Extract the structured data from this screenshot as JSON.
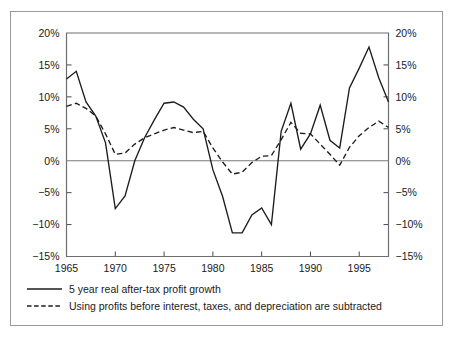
{
  "chart_data": {
    "type": "line",
    "title": "",
    "subtitle": "",
    "xlabel": "",
    "ylabel": "",
    "xlim": [
      1965,
      1998
    ],
    "ylim": [
      -15,
      20
    ],
    "ytick_labels": [
      "20%",
      "15%",
      "10%",
      "5%",
      "0%",
      "-5%",
      "-10%",
      "-15%"
    ],
    "ytick_values": [
      20,
      15,
      10,
      5,
      0,
      -5,
      -10,
      -15
    ],
    "ytick_labels_right": [
      "20%",
      "15%",
      "10%",
      "5%",
      "0%",
      "-5%",
      "-10%",
      "-15%"
    ],
    "xtick_labels": [
      "1965",
      "1970",
      "1975",
      "1980",
      "1985",
      "1990",
      "1995"
    ],
    "xtick_values": [
      1965,
      1970,
      1975,
      1980,
      1985,
      1990,
      1995
    ],
    "grid": false,
    "legend_position": "below-plot",
    "zero_line": true,
    "axis_unit": "percent",
    "x": [
      1965,
      1966,
      1967,
      1968,
      1969,
      1970,
      1971,
      1972,
      1973,
      1974,
      1975,
      1976,
      1977,
      1978,
      1979,
      1980,
      1981,
      1982,
      1983,
      1984,
      1985,
      1986,
      1987,
      1988,
      1989,
      1990,
      1991,
      1992,
      1993,
      1994,
      1995,
      1996,
      1997,
      1998
    ],
    "series": [
      {
        "name": "5 year real after-tax profit growth",
        "style": "solid",
        "color": "#1c1c1c",
        "values": [
          12.8,
          14.0,
          9.2,
          7.0,
          2.8,
          -7.5,
          -5.5,
          0.0,
          3.6,
          6.4,
          9.0,
          9.2,
          8.4,
          6.5,
          5.0,
          -1.4,
          -5.6,
          -11.3,
          -11.3,
          -8.5,
          -7.4,
          -10.0,
          4.6,
          9.0,
          1.8,
          4.2,
          8.7,
          3.2,
          2.0,
          11.4,
          14.5,
          17.8,
          13.0,
          9.2
        ]
      },
      {
        "name": "Using profits before interest, taxes, and depreciation are subtracted",
        "style": "dashed",
        "color": "#1c1c1c",
        "values": [
          8.5,
          9.0,
          8.2,
          7.0,
          4.2,
          1.0,
          1.2,
          2.6,
          3.6,
          4.2,
          4.8,
          5.2,
          4.8,
          4.4,
          4.6,
          2.0,
          -0.2,
          -2.1,
          -1.8,
          -0.3,
          0.7,
          0.8,
          3.3,
          6.0,
          4.3,
          4.2,
          2.6,
          1.0,
          -0.7,
          2.1,
          3.9,
          5.2,
          6.2,
          5.2
        ]
      }
    ]
  },
  "legend": {
    "items": [
      {
        "label": "5 year real after-tax profit growth",
        "marker": "solid-line"
      },
      {
        "label": "Using profits before interest, taxes, and depreciation are subtracted",
        "marker": "dashed-line"
      }
    ]
  },
  "colors": {
    "line": "#1c1c1c",
    "axis": "#6e6e6e",
    "frame": "#9a9a9a",
    "background": "#ffffff",
    "text": "#1a1a1a"
  }
}
